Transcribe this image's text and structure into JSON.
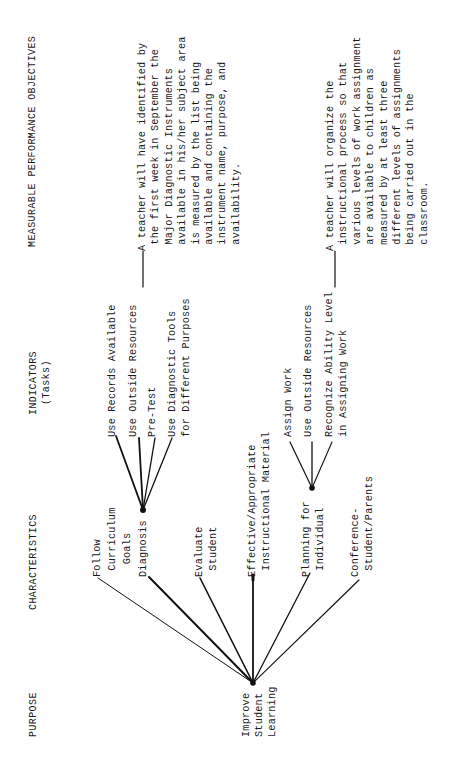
{
  "headers": {
    "objectives": "MEASURABLE PERFORMANCE OBJECTIVES",
    "indicators": "INDICATORS",
    "indicators_sub": "(Tasks)",
    "characteristics": "CHARACTERISTICS",
    "purpose": "PURPOSE"
  },
  "purpose": "Improve\nStudent\nLearning",
  "characteristics": [
    "Follow\n Curriculum\n  Goals",
    "Diagnosis",
    "Evaluate\n Student",
    "Effective/Appropriate\n Instructional Material",
    "Planning for\n Individual",
    "Conference-\n Student/Parents"
  ],
  "indicators_diagnosis": [
    "Use Records Available",
    "Use Outside Resources",
    "Pre-Test",
    "Use Diagnostic Tools\nfor Different Purposes"
  ],
  "indicators_planning": [
    "Assign Work",
    "Use Outside Resources",
    "Recognize Ability Level\nin Assigning Work"
  ],
  "objectives": [
    "A teacher will have identified by\n the first week in September the\n Major Diagnostic Instruments\n available in his/her subject area\n is measured by the list being\n available and containing the\n instrument name, purpose, and\n availability.",
    "A teacher will organize the\n instructional process so that\n various levels of work assignment\n are available to children as\n measured by at least three\n different levels of assignments\n being carried out in the\n classroom."
  ]
}
